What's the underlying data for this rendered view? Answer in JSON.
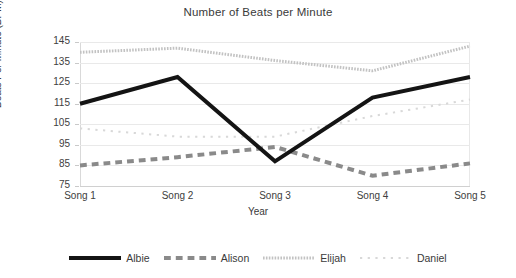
{
  "chart_data": {
    "type": "line",
    "title": "Number of Beats per Minute",
    "xlabel": "Year",
    "ylabel": "Beats Per Minute (BPM)",
    "categories": [
      "Song 1",
      "Song 2",
      "Song 3",
      "Song 4",
      "Song 5"
    ],
    "ylim": [
      75,
      145
    ],
    "yticks": [
      75,
      85,
      95,
      105,
      115,
      125,
      135,
      145
    ],
    "grid": true,
    "legend_position": "bottom",
    "series": [
      {
        "name": "Albie",
        "values": [
          115,
          128,
          87,
          118,
          128
        ],
        "color": "#141414",
        "style": "solid",
        "width": 4
      },
      {
        "name": "Alison",
        "values": [
          85,
          89,
          94,
          80,
          86
        ],
        "color": "#8a8a8a",
        "style": "dashed",
        "width": 4
      },
      {
        "name": "Elijah",
        "values": [
          140,
          142,
          136,
          131,
          143
        ],
        "color": "#c2c2c2",
        "style": "fine-dotted",
        "width": 3
      },
      {
        "name": "Daniel",
        "values": [
          103,
          99,
          99,
          109,
          117
        ],
        "color": "#d8d8d8",
        "style": "sparse-dotted",
        "width": 2
      }
    ]
  }
}
